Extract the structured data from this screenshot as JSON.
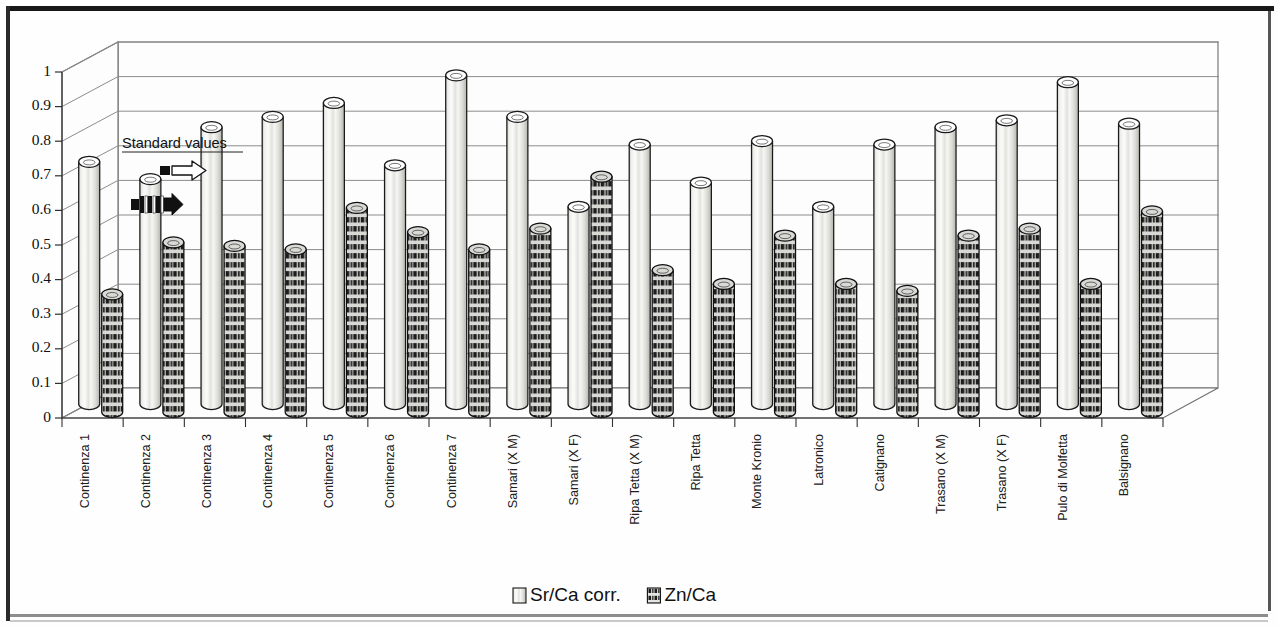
{
  "chart_data": {
    "type": "bar",
    "title": "",
    "subtitle": "",
    "xlabel": "",
    "ylabel": "",
    "ylim": [
      0,
      1
    ],
    "ytick_labels": [
      "0",
      "0.1",
      "0.2",
      "0.3",
      "0.4",
      "0.5",
      "0.6",
      "0.7",
      "0.8",
      "0.9",
      "1"
    ],
    "ytick_values": [
      0,
      0.1,
      0.2,
      0.3,
      0.4,
      0.5,
      0.6,
      0.7,
      0.8,
      0.9,
      1
    ],
    "grid": true,
    "three_d": true,
    "bar_shape": "cylinder",
    "legend_position": "bottom",
    "categories": [
      "Continenza 1",
      "Continenza 2",
      "Continenza 3",
      "Continenza 4",
      "Continenza 5",
      "Continenza 6",
      "Continenza 7",
      "Samari (X M)",
      "Samari (X F)",
      "Ripa Tetta (X M)",
      "Ripa Tetta",
      "Monte Kronio",
      "Latronico",
      "Catignano",
      "Trasano (X M)",
      "Trasano (X F)",
      "Pulo di Molfetta",
      "Balsignano"
    ],
    "series": [
      {
        "name": "Sr/Ca corr.",
        "fill": "#e8e8e4",
        "pattern": "solid-light",
        "values": [
          0.7,
          0.65,
          0.8,
          0.83,
          0.87,
          0.69,
          0.95,
          0.83,
          0.57,
          0.75,
          0.64,
          0.76,
          0.57,
          0.75,
          0.8,
          0.82,
          0.93,
          0.81
        ]
      },
      {
        "name": "Zn/Ca",
        "fill": "#3a3a3a",
        "pattern": "checkered-dark",
        "values": [
          0.34,
          0.49,
          0.48,
          0.47,
          0.59,
          0.52,
          0.47,
          0.53,
          0.68,
          0.41,
          0.37,
          0.51,
          0.37,
          0.35,
          0.51,
          0.53,
          0.37,
          0.58
        ]
      }
    ],
    "annotations": [
      {
        "text": "Standard values",
        "marker_srca_value": 0.72,
        "marker_znca_value": 0.62
      }
    ]
  },
  "legend": {
    "items": [
      {
        "label": "Sr/Ca corr.",
        "swatch": "light-cylinder-swatch"
      },
      {
        "label": "Zn/Ca",
        "swatch": "dark-checkered-swatch"
      }
    ]
  },
  "colors": {
    "axis": "#303030",
    "grid": "#8c8c8c",
    "wall": "#fdfdfd",
    "series_light": "#e9e9e5",
    "series_dark": "#3c3c3c",
    "page_border": "#181818"
  }
}
